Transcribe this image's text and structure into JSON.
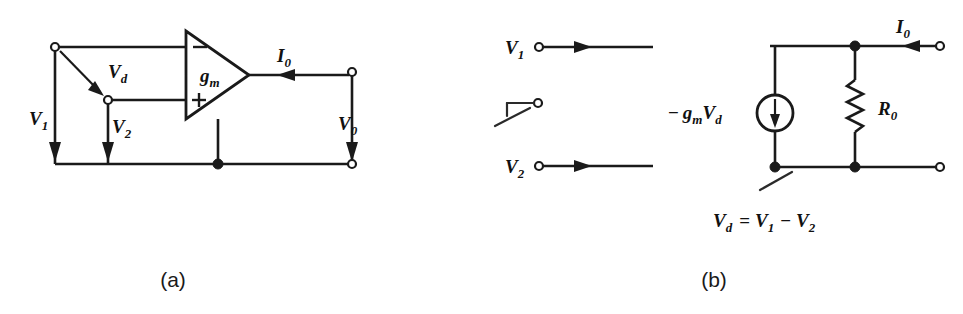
{
  "figure": {
    "background_color": "#ffffff",
    "ink_color": "#1a1a1a"
  },
  "panel_a": {
    "caption": "(a)",
    "amplifier": {
      "type": "transconductance-amplifier-triangle",
      "gain_label": "g",
      "gain_sub": "m",
      "minus_input": "−",
      "plus_input": "+"
    },
    "labels": {
      "v1": "V",
      "v1_sub": "1",
      "v2": "V",
      "v2_sub": "2",
      "vd": "V",
      "vd_sub": "d",
      "vo": "V",
      "vo_sub": "0",
      "io": "I",
      "io_sub": "0"
    },
    "terminals": [
      "V1-input-terminal",
      "V2-input-terminal",
      "output-top-terminal",
      "output-bottom-terminal"
    ],
    "arrows": {
      "v1_direction": "down",
      "v2_direction": "down",
      "vd_direction": "down-right-diagonal",
      "vo_direction": "down",
      "io_direction": "left"
    }
  },
  "panel_b": {
    "caption": "(b)",
    "source": {
      "type": "dependent-current-source",
      "label_sign": "−",
      "label_g": "g",
      "label_g_sub": "m",
      "label_v": "V",
      "label_v_sub": "d",
      "arrow_direction": "down"
    },
    "resistor": {
      "label": "R",
      "label_sub": "0",
      "type": "zigzag"
    },
    "labels": {
      "v1": "V",
      "v1_sub": "1",
      "v2": "V",
      "v2_sub": "2",
      "io": "I",
      "io_sub": "0"
    },
    "equation": {
      "lhs": "V",
      "lhs_sub": "d",
      "eq": "=",
      "term1": "V",
      "term1_sub": "1",
      "minus": "−",
      "term2": "V",
      "term2_sub": "2",
      "full_text": "Vd = V1 - V2"
    },
    "arrows": {
      "v1_direction": "right",
      "v2_direction": "right",
      "io_direction": "left"
    }
  }
}
